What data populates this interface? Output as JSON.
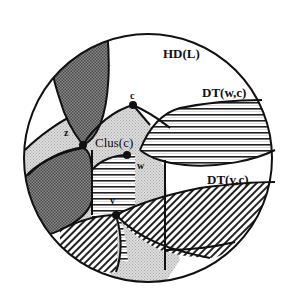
{
  "diagram": {
    "region_labels": {
      "hd": "HD(L)",
      "dt_wc": "DT(w,c)",
      "dt_vc": "DT(v,c)",
      "clus": "Clus(c)"
    },
    "point_labels": {
      "z": "z",
      "c": "c",
      "w": "w",
      "v": "v"
    },
    "colors": {
      "outline": "#111111",
      "dark_region": "#6e6e6e",
      "light_region": "#c9c9c9",
      "background": "#ffffff",
      "hatch": "#222222"
    }
  }
}
